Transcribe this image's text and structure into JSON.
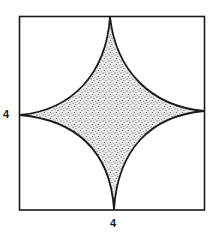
{
  "figure": {
    "labels": {
      "left_side": "4",
      "bottom_side": "4"
    },
    "square": {
      "side": 4
    },
    "shape": "astroid",
    "colors": {
      "stroke": "#1a1a1a",
      "fill_base": "#e6e6e6",
      "stipple": "#3a3a3a",
      "background": "#ffffff"
    }
  }
}
